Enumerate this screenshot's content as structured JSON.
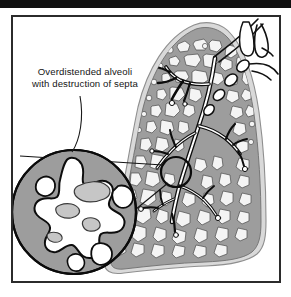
{
  "figure": {
    "title": "Overdistended alveoli with destruction of septa",
    "background_color": "#ffffff",
    "top_bar_color": "#101010",
    "frame_color": "#2b2b2b"
  },
  "annotation": {
    "line1": "Overdistended alveoli",
    "line2": "with destruction of septa",
    "text_color": "#151515",
    "leader_line_color": "#1a1a1a"
  },
  "lung": {
    "label": "lung-cross-section",
    "pleura_color": "#d8d8d8",
    "parenchyma_color": "#9a9a9a",
    "alveoli_color": "#f2f2f2",
    "airway_outline_color": "#0d0d0d",
    "airway_lumen_color": "#ffffff"
  },
  "magnifier": {
    "label": "magnified-alveoli-inset",
    "marker_label": "magnification-source-circle",
    "marker_center_x": 176,
    "marker_center_y": 172,
    "marker_radius": 15,
    "inset_center_x": 74,
    "inset_center_y": 212,
    "inset_radius": 62,
    "inset_fill_color": "#9a9a9a",
    "airspace_color": "#ffffff",
    "septal_remnant_color": "#c3c3c3",
    "outline_color": "#111111"
  },
  "vessels": {
    "label": "bronchus-and-vessel-structures",
    "outline_color": "#111111",
    "fill_color": "#ffffff"
  }
}
